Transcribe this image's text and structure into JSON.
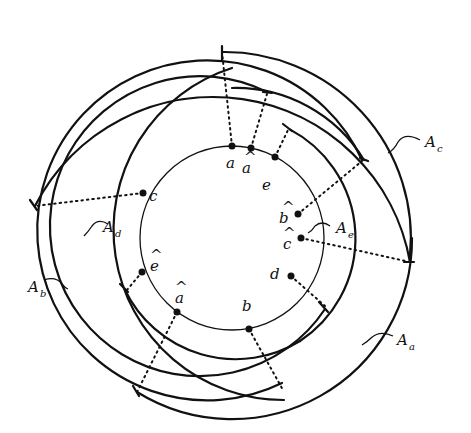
{
  "diagram": {
    "center": {
      "x": 232,
      "y": 238
    },
    "inner_circle_radius": 92,
    "points": [
      {
        "id": "a",
        "label": "a",
        "hat": false,
        "angle": -90
      },
      {
        "id": "a-hat-top",
        "label": "a",
        "hat": true,
        "angle": -78
      },
      {
        "id": "e",
        "label": "e",
        "hat": false,
        "angle": -62
      },
      {
        "id": "b-hat",
        "label": "b",
        "hat": true,
        "angle": -20
      },
      {
        "id": "c-hat",
        "label": "c",
        "hat": true,
        "angle": 0
      },
      {
        "id": "d",
        "label": "d",
        "hat": false,
        "angle": 23
      },
      {
        "id": "b",
        "label": "b",
        "hat": false,
        "angle": 80
      },
      {
        "id": "a-hat",
        "label": "a",
        "hat": true,
        "angle": 122
      },
      {
        "id": "e-hat",
        "label": "e",
        "hat": true,
        "angle": 148
      },
      {
        "id": "c",
        "label": "c",
        "hat": false,
        "angle": 212
      }
    ],
    "arcs": [
      {
        "name": "A_a",
        "label": "A",
        "sub": "a"
      },
      {
        "name": "A_b",
        "label": "A",
        "sub": "b"
      },
      {
        "name": "A_c",
        "label": "A",
        "sub": "c"
      },
      {
        "name": "A_d",
        "label": "A",
        "sub": "d"
      },
      {
        "name": "A_e",
        "label": "A",
        "sub": "e"
      }
    ],
    "hat_glyph": "^"
  }
}
